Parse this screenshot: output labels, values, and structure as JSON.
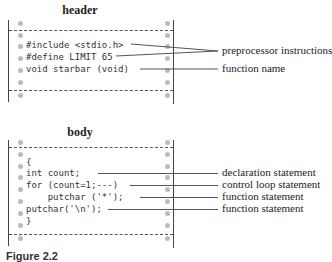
{
  "header_section": {
    "title": "header",
    "code_lines": [
      "#include <stdio.h>",
      "#define LIMIT 65",
      "void starbar (void)"
    ],
    "annotations": [
      "preprocessor instructions",
      "function name"
    ]
  },
  "body_section": {
    "title": "body",
    "code_lines": [
      "{",
      "int count;",
      "for (count=1;---)",
      "    putchar ('*');",
      "putchar('\\n');",
      "}"
    ],
    "annotations": [
      "declaration statement",
      "control loop statement",
      "function statement",
      "function statement"
    ]
  },
  "caption": "Figure 2.2"
}
